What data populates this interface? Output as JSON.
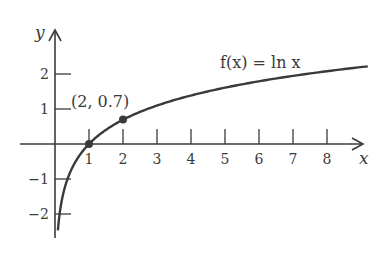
{
  "chart_data": {
    "type": "line",
    "title": "",
    "function_label": "f(x) = ln x",
    "xlabel": "x",
    "ylabel": "y",
    "xlim": [
      0,
      9
    ],
    "ylim": [
      -3,
      2.5
    ],
    "x_ticks": [
      1,
      2,
      3,
      4,
      5,
      6,
      7,
      8
    ],
    "x_tick_labels": [
      "1",
      "2",
      "3",
      "4",
      "5",
      "6",
      "7",
      "8"
    ],
    "y_ticks": [
      2,
      1,
      -1,
      -2
    ],
    "y_tick_labels": [
      "2",
      "1",
      "-1",
      "-2"
    ],
    "grid": false,
    "legend": null,
    "series": [
      {
        "name": "f(x) = ln x",
        "x": [
          0.08,
          0.1,
          0.2,
          0.5,
          1,
          2,
          3,
          4,
          5,
          6,
          7,
          8,
          9.2
        ],
        "values": [
          -2.53,
          -2.3,
          -1.61,
          -0.69,
          0,
          0.69,
          1.1,
          1.39,
          1.61,
          1.79,
          1.95,
          2.08,
          2.22
        ]
      }
    ],
    "points": [
      {
        "x": 1,
        "y": 0,
        "label": ""
      },
      {
        "x": 2,
        "y": 0.7,
        "label": "(2, 0.7)"
      }
    ],
    "annotations": [
      "(2, 0.7)",
      "f(x) = ln x"
    ]
  },
  "colors": {
    "ink": "#3a3a3a",
    "background": "#ffffff"
  }
}
